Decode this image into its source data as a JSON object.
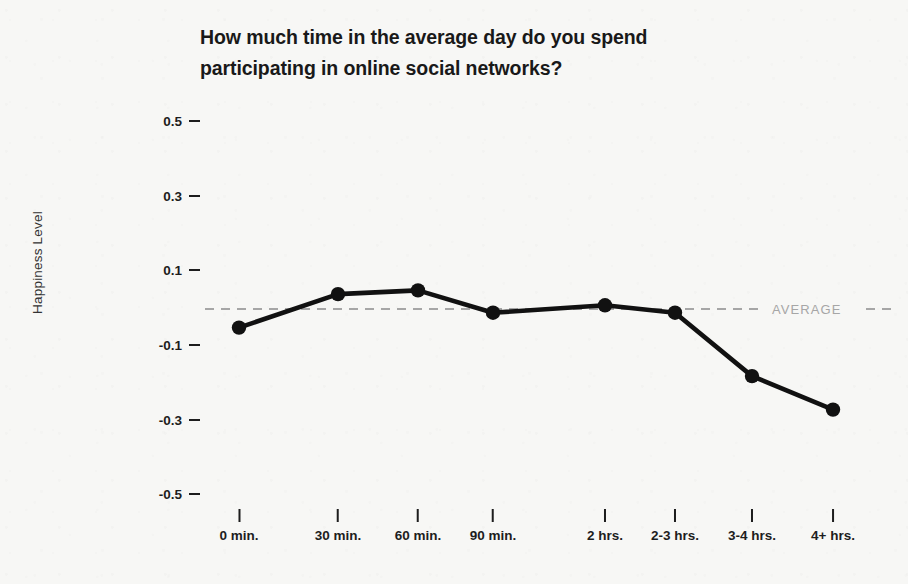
{
  "chart_data": {
    "type": "line",
    "title": "How much time in the average day do you spend participating in online social networks?",
    "title_lines": [
      "How much time in the average day do you spend",
      "participating in online social networks?"
    ],
    "xlabel": "",
    "ylabel": "Happiness Level",
    "categories": [
      "0 min.",
      "30 min.",
      "60 min.",
      "90 min.",
      "2 hrs.",
      "2-3 hrs.",
      "3-4 hrs.",
      "4+ hrs."
    ],
    "values": [
      -0.05,
      0.04,
      0.05,
      -0.01,
      0.01,
      -0.01,
      -0.18,
      -0.27
    ],
    "ylim": [
      -0.5,
      0.5
    ],
    "y_ticks": [
      "0.5",
      "0.3",
      "0.1",
      "-0.1",
      "-0.3",
      "-0.5"
    ],
    "y_tick_values": [
      0.5,
      0.3,
      0.1,
      -0.1,
      -0.3,
      -0.5
    ],
    "grid": false,
    "legend": "none",
    "annotations": [
      {
        "name": "average-line",
        "label": "AVERAGE",
        "value": 0,
        "style": "dashed"
      }
    ],
    "series_color": "#111111",
    "average_color": "#a6a6a6",
    "background_color": "#f7f7f5"
  }
}
